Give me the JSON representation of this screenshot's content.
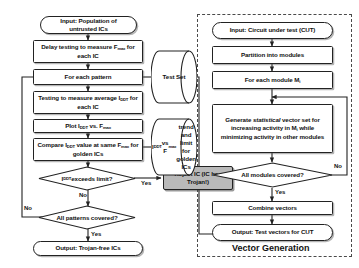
{
  "figure": {
    "type": "flowchart",
    "panels": [
      {
        "name": "ic-testing-flow",
        "title": ""
      },
      {
        "name": "vector-generation",
        "title": "Vector Generation"
      }
    ]
  },
  "left_flow": {
    "input": "Input: Population of untrusted ICs",
    "delay_test": "Delay testing to measure F<sub>max</sub> for each IC",
    "for_each_pattern": "For each pattern",
    "measure_iddt": "Testing to measure average I<sub>DDT</sub> for each IC",
    "plot": "Plot I<sub>DDT</sub> vs. F<sub>max</sub>",
    "compare": "Compare I<sub>DDT</sub> value at same F<sub>max</sub> for golden ICs",
    "decision_limit": "I<sub>DDT</sub> exceeds limit?",
    "decision_patterns": "All patterns covered?",
    "reject": "Reject IC (IC has Trojan!)",
    "output": "Output: Trojan-free ICs",
    "labels": {
      "limit_yes": "Yes",
      "limit_no": "No",
      "patterns_yes": "Yes",
      "patterns_no": "No"
    }
  },
  "data_stores": {
    "test_set": "Test Set",
    "golden_trend": "I<sub>DDT</sub> vs F<sub>max</sub> trend and limit for golden ICs"
  },
  "right_flow": {
    "input": "Input: Circuit under test (CUT)",
    "partition": "Partition into modules",
    "for_each_module": "For each module M<sub>i</sub>",
    "generate": "Generate <span class=\"ital\">statistical</span> vector set for increasing activity in M<sub>i</sub> while minimizing activity in other modules",
    "decision_modules": "All modules covered?",
    "combine": "Combine vectors",
    "output": "Output: Test vectors for CUT",
    "panel_title": "Vector Generation",
    "labels": {
      "modules_yes": "Yes",
      "modules_no": "No"
    }
  },
  "colors": {
    "stroke": "#222222",
    "fill": "#ffffff",
    "reject_fill": "#b9b9b9",
    "dashed": "#4a4a4a",
    "text": "#111111"
  }
}
